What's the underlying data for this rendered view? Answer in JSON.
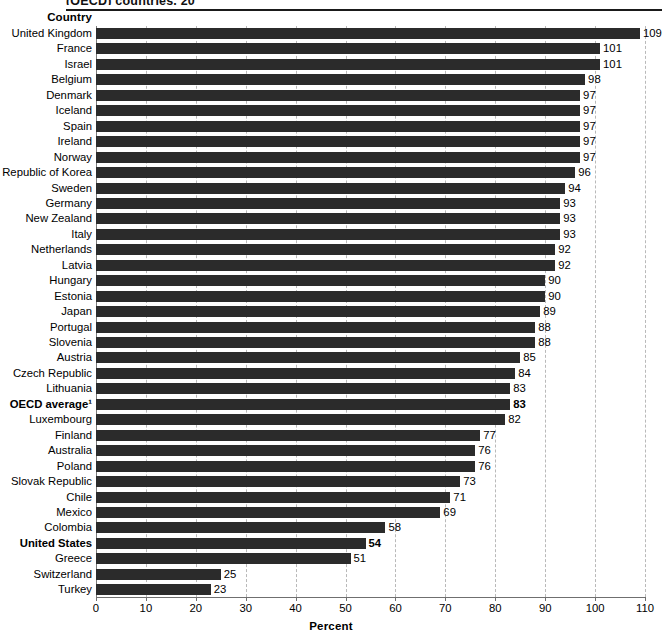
{
  "figure": {
    "title_partial": "(OECD) countries, 20",
    "column_header": "Country",
    "axis_title": "Percent"
  },
  "chart_data": {
    "type": "bar",
    "orientation": "horizontal",
    "title": "(OECD) countries, 20",
    "xlabel": "Percent",
    "ylabel": "Country",
    "xlim": [
      0,
      110
    ],
    "xticks": [
      0,
      10,
      20,
      30,
      40,
      50,
      60,
      70,
      80,
      90,
      100,
      110
    ],
    "grid": "vertical-dashed",
    "legend": "none",
    "bar_color": "#2b2b2b",
    "footnote_marker": "1",
    "categories": [
      "United Kingdom",
      "France",
      "Israel",
      "Belgium",
      "Denmark",
      "Iceland",
      "Spain",
      "Ireland",
      "Norway",
      "Republic of Korea",
      "Sweden",
      "Germany",
      "New Zealand",
      "Italy",
      "Netherlands",
      "Latvia",
      "Hungary",
      "Estonia",
      "Japan",
      "Portugal",
      "Slovenia",
      "Austria",
      "Czech Republic",
      "Lithuania",
      "OECD average",
      "Luxembourg",
      "Finland",
      "Australia",
      "Poland",
      "Slovak Republic",
      "Chile",
      "Mexico",
      "Colombia",
      "United States",
      "Greece",
      "Switzerland",
      "Turkey"
    ],
    "values": [
      109,
      101,
      101,
      98,
      97,
      97,
      97,
      97,
      97,
      96,
      94,
      93,
      93,
      93,
      92,
      92,
      90,
      90,
      89,
      88,
      88,
      85,
      84,
      83,
      83,
      82,
      77,
      76,
      76,
      73,
      71,
      69,
      58,
      54,
      51,
      25,
      23
    ],
    "rows": [
      {
        "label": "United Kingdom",
        "value": 109,
        "emphasis": false
      },
      {
        "label": "France",
        "value": 101,
        "emphasis": false
      },
      {
        "label": "Israel",
        "value": 101,
        "emphasis": false
      },
      {
        "label": "Belgium",
        "value": 98,
        "emphasis": false
      },
      {
        "label": "Denmark",
        "value": 97,
        "emphasis": false
      },
      {
        "label": "Iceland",
        "value": 97,
        "emphasis": false
      },
      {
        "label": "Spain",
        "value": 97,
        "emphasis": false
      },
      {
        "label": "Ireland",
        "value": 97,
        "emphasis": false
      },
      {
        "label": "Norway",
        "value": 97,
        "emphasis": false
      },
      {
        "label": "Republic of Korea",
        "value": 96,
        "emphasis": false
      },
      {
        "label": "Sweden",
        "value": 94,
        "emphasis": false
      },
      {
        "label": "Germany",
        "value": 93,
        "emphasis": false
      },
      {
        "label": "New Zealand",
        "value": 93,
        "emphasis": false
      },
      {
        "label": "Italy",
        "value": 93,
        "emphasis": false
      },
      {
        "label": "Netherlands",
        "value": 92,
        "emphasis": false
      },
      {
        "label": "Latvia",
        "value": 92,
        "emphasis": false
      },
      {
        "label": "Hungary",
        "value": 90,
        "emphasis": false
      },
      {
        "label": "Estonia",
        "value": 90,
        "emphasis": false
      },
      {
        "label": "Japan",
        "value": 89,
        "emphasis": false
      },
      {
        "label": "Portugal",
        "value": 88,
        "emphasis": false
      },
      {
        "label": "Slovenia",
        "value": 88,
        "emphasis": false
      },
      {
        "label": "Austria",
        "value": 85,
        "emphasis": false
      },
      {
        "label": "Czech Republic",
        "value": 84,
        "emphasis": false
      },
      {
        "label": "Lithuania",
        "value": 83,
        "emphasis": false
      },
      {
        "label": "OECD average¹",
        "value": 83,
        "emphasis": true
      },
      {
        "label": "Luxembourg",
        "value": 82,
        "emphasis": false
      },
      {
        "label": "Finland",
        "value": 77,
        "emphasis": false
      },
      {
        "label": "Australia",
        "value": 76,
        "emphasis": false
      },
      {
        "label": "Poland",
        "value": 76,
        "emphasis": false
      },
      {
        "label": "Slovak Republic",
        "value": 73,
        "emphasis": false
      },
      {
        "label": "Chile",
        "value": 71,
        "emphasis": false
      },
      {
        "label": "Mexico",
        "value": 69,
        "emphasis": false
      },
      {
        "label": "Colombia",
        "value": 58,
        "emphasis": false
      },
      {
        "label": "United States",
        "value": 54,
        "emphasis": true
      },
      {
        "label": "Greece",
        "value": 51,
        "emphasis": false
      },
      {
        "label": "Switzerland",
        "value": 25,
        "emphasis": false
      },
      {
        "label": "Turkey",
        "value": 23,
        "emphasis": false
      }
    ]
  }
}
